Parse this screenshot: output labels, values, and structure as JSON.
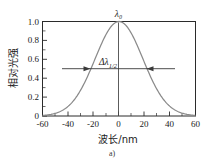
{
  "chart_data": {
    "type": "line",
    "title": "",
    "xlabel": "波长/nm",
    "ylabel": "相对光强",
    "xlim": [
      -60,
      60
    ],
    "ylim": [
      0,
      1.0
    ],
    "grid": false,
    "legend": null,
    "x_ticks": [
      "-60",
      "-40",
      "-20",
      "0",
      "20",
      "40",
      "60"
    ],
    "x_tick_values": [
      -60,
      -40,
      -20,
      0,
      20,
      40,
      60
    ],
    "x_minor_tick_values": [
      -50,
      -30,
      -10,
      10,
      30,
      50
    ],
    "y_ticks": [
      "1.0",
      "0.8",
      "0.6",
      "0.4",
      "0.2",
      "0"
    ],
    "y_tick_values": [
      1.0,
      0.8,
      0.6,
      0.4,
      0.2,
      0
    ],
    "series": [
      {
        "name": "relative-intensity",
        "x": [
          -60,
          -55,
          -50,
          -45,
          -40,
          -35,
          -30,
          -25,
          -20,
          -15,
          -10,
          -5,
          0,
          5,
          10,
          15,
          20,
          25,
          30,
          35,
          40,
          45,
          50,
          55,
          60
        ],
        "values": [
          0.0,
          0.0,
          0.005,
          0.02,
          0.055,
          0.12,
          0.22,
          0.37,
          0.55,
          0.73,
          0.89,
          0.98,
          1.0,
          0.98,
          0.89,
          0.73,
          0.55,
          0.37,
          0.22,
          0.12,
          0.055,
          0.02,
          0.005,
          0.0,
          0.0
        ]
      }
    ],
    "annotations": [
      {
        "name": "peak-center",
        "label": "λ₀",
        "label_plain": "lambda-0",
        "x": 0,
        "y": 1.0,
        "marker": "vertical-drop-line"
      },
      {
        "name": "fwhm",
        "label_delta": "Δλ",
        "label_subscript": "1/2",
        "label_full": "Δλ1/2",
        "y": 0.5,
        "x_left": -22,
        "x_right": 22,
        "marker": "double-headed-arrow-outward"
      }
    ]
  },
  "figure": {
    "caption": "a)",
    "ylabel": "相对光强",
    "xlabel": "波长/nm",
    "peak_label": "λ₀",
    "fwhm_delta": "Δλ",
    "fwhm_sub": "1/2"
  },
  "colors": {
    "background": "#ffffff",
    "frame": "#2b2b2b",
    "curve": "#8a8a8a",
    "text": "#1a1a1a",
    "annotation": "#3a3a3a"
  }
}
